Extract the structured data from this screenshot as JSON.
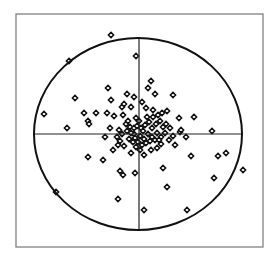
{
  "chart_data": {
    "type": "scatter",
    "title": "",
    "xlabel": "",
    "ylabel": "",
    "grid": false,
    "legend": null,
    "marker": "open-diamond",
    "colors": {
      "background": "#ffffff",
      "frame": "#8a8a8a",
      "ellipse": "#111111",
      "axes": "#222222",
      "marker_stroke": "#111111",
      "marker_fill": "#ffffff"
    },
    "frame": {
      "x": 16,
      "y": 14,
      "width": 247,
      "height": 233
    },
    "ellipse": {
      "cx": 138,
      "cy": 134,
      "rx": 104,
      "ry": 96
    },
    "crosshair": {
      "x": 139,
      "y": 134
    },
    "coordinate_note": "points are pixel positions within the 278x260 image; crosshair marks origin",
    "points": [
      [
        111,
        35
      ],
      [
        69,
        61
      ],
      [
        136,
        56
      ],
      [
        108,
        88
      ],
      [
        75,
        98
      ],
      [
        44,
        114
      ],
      [
        127,
        94
      ],
      [
        134,
        97
      ],
      [
        111,
        100
      ],
      [
        122,
        107
      ],
      [
        124,
        104
      ],
      [
        131,
        107
      ],
      [
        84,
        113
      ],
      [
        96,
        113
      ],
      [
        107,
        113
      ],
      [
        114,
        116
      ],
      [
        88,
        121
      ],
      [
        89,
        124
      ],
      [
        136,
        118
      ],
      [
        67,
        128
      ],
      [
        151,
        81
      ],
      [
        155,
        94
      ],
      [
        173,
        95
      ],
      [
        142,
        102
      ],
      [
        146,
        108
      ],
      [
        153,
        110
      ],
      [
        167,
        111
      ],
      [
        194,
        117
      ],
      [
        148,
        88
      ],
      [
        179,
        118
      ],
      [
        105,
        137
      ],
      [
        88,
        157
      ],
      [
        103,
        160
      ],
      [
        120,
        141
      ],
      [
        118,
        145
      ],
      [
        124,
        146
      ],
      [
        132,
        141
      ],
      [
        131,
        153
      ],
      [
        120,
        171
      ],
      [
        123,
        175
      ],
      [
        135,
        173
      ],
      [
        56,
        192
      ],
      [
        118,
        199
      ],
      [
        134,
        134
      ],
      [
        144,
        155
      ],
      [
        157,
        148
      ],
      [
        161,
        144
      ],
      [
        175,
        145
      ],
      [
        191,
        156
      ],
      [
        163,
        168
      ],
      [
        218,
        156
      ],
      [
        226,
        153
      ],
      [
        243,
        170
      ],
      [
        214,
        178
      ],
      [
        167,
        187
      ],
      [
        144,
        210
      ],
      [
        187,
        210
      ],
      [
        212,
        131
      ],
      [
        180,
        132
      ],
      [
        181,
        130
      ],
      [
        126,
        124
      ],
      [
        130,
        127
      ],
      [
        134,
        128
      ],
      [
        137,
        126
      ],
      [
        141,
        128
      ],
      [
        145,
        125
      ],
      [
        149,
        122
      ],
      [
        152,
        128
      ],
      [
        156,
        124
      ],
      [
        160,
        121
      ],
      [
        163,
        127
      ],
      [
        166,
        124
      ],
      [
        127,
        131
      ],
      [
        131,
        133
      ],
      [
        135,
        138
      ],
      [
        140,
        136
      ],
      [
        144,
        139
      ],
      [
        148,
        134
      ],
      [
        152,
        137
      ],
      [
        157,
        133
      ],
      [
        161,
        137
      ],
      [
        165,
        133
      ],
      [
        129,
        139
      ],
      [
        133,
        142
      ],
      [
        138,
        142
      ],
      [
        142,
        145
      ],
      [
        146,
        143
      ],
      [
        150,
        141
      ],
      [
        155,
        140
      ],
      [
        159,
        140
      ],
      [
        122,
        134
      ],
      [
        119,
        130
      ],
      [
        117,
        137
      ],
      [
        128,
        121
      ],
      [
        147,
        117
      ],
      [
        153,
        117
      ],
      [
        158,
        115
      ],
      [
        170,
        128
      ],
      [
        173,
        136
      ],
      [
        169,
        140
      ],
      [
        113,
        150
      ],
      [
        110,
        128
      ],
      [
        140,
        150
      ],
      [
        136,
        147
      ],
      [
        151,
        150
      ],
      [
        186,
        137
      ],
      [
        162,
        113
      ],
      [
        123,
        115
      ],
      [
        143,
        131
      ],
      [
        139,
        121
      ]
    ]
  }
}
